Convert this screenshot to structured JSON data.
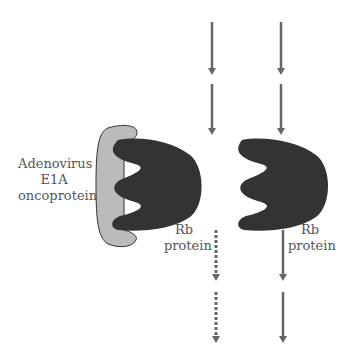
{
  "labels": {
    "e1a_line1": "Adenovirus",
    "e1a_line2": "E1A",
    "e1a_line3": "oncoprotein",
    "rb_left_line1": "Rb",
    "rb_left_line2": "protein",
    "rb_right_line1": "Rb",
    "rb_right_line2": "protein"
  },
  "colors": {
    "rb_protein": "#333333",
    "e1a_protein": "#bbbbbb",
    "arrow": "#666666",
    "text": "#555555"
  }
}
